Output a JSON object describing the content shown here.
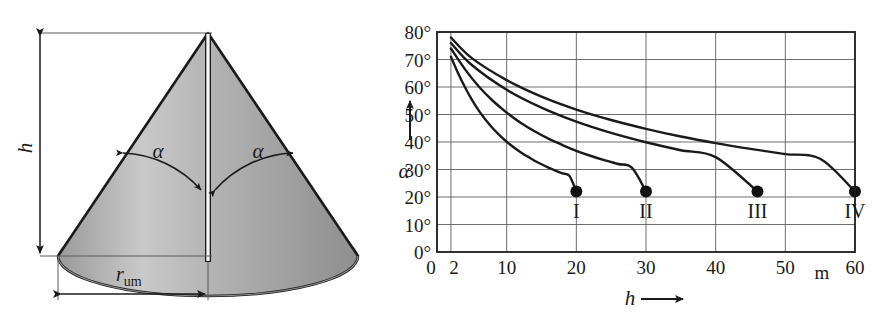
{
  "figure": {
    "cone_diagram": {
      "name": "cone-with-apex-angle",
      "height_label": "h",
      "radius_label_main": "r",
      "radius_label_sub": "um",
      "angle_label_left": "α",
      "angle_label_right": "α",
      "fill_color": "#a8a8a8",
      "edge_color": "#1a1a1a",
      "base_color": "#b4b4b4"
    }
  },
  "chart_data": {
    "type": "line",
    "title": "",
    "xlabel": "h",
    "ylabel": "α",
    "xunit": "m",
    "xlim": [
      0,
      60
    ],
    "ylim": [
      0,
      80
    ],
    "grid": true,
    "legend_position": "inline-at-endpoints",
    "x_tick_labels": [
      "0",
      "2",
      "10",
      "20",
      "30",
      "40",
      "50",
      "60"
    ],
    "x_tick_values": [
      0,
      2,
      10,
      20,
      30,
      40,
      50,
      60
    ],
    "y_tick_labels": [
      "0°",
      "10°",
      "20°",
      "30°",
      "40°",
      "50°",
      "60°",
      "70°",
      "80°"
    ],
    "y_tick_values": [
      0,
      10,
      20,
      30,
      40,
      50,
      60,
      70,
      80
    ],
    "y_axis_arrow": true,
    "x_axis_arrow": true,
    "marker_color": "#111111",
    "line_color": "#1a1a1a",
    "series": [
      {
        "name": "I",
        "endpoint_label": "I",
        "endpoint": [
          20,
          22
        ],
        "x": [
          2,
          3,
          4,
          5,
          6,
          7,
          8,
          9,
          10,
          11,
          12,
          13,
          14,
          15,
          16,
          17,
          18,
          19,
          20
        ],
        "values": [
          71.0,
          65.2,
          60.0,
          55.4,
          51.4,
          48.0,
          45.0,
          42.4,
          40.1,
          38.1,
          36.3,
          34.7,
          33.2,
          31.9,
          30.7,
          29.6,
          28.6,
          27.7,
          22.0
        ]
      },
      {
        "name": "II",
        "endpoint_label": "II",
        "endpoint": [
          30,
          22
        ],
        "x": [
          2,
          4,
          6,
          8,
          10,
          12,
          14,
          16,
          18,
          20,
          22,
          24,
          26,
          28,
          30
        ],
        "values": [
          74.0,
          66.5,
          60.2,
          55.0,
          50.7,
          47.0,
          43.9,
          41.2,
          38.9,
          36.8,
          35.0,
          33.4,
          32.0,
          30.6,
          22.0
        ]
      },
      {
        "name": "III",
        "endpoint_label": "III",
        "endpoint": [
          46,
          22
        ],
        "x": [
          2,
          5,
          10,
          15,
          20,
          25,
          30,
          35,
          40,
          46
        ],
        "values": [
          76.0,
          68.0,
          59.0,
          52.5,
          47.4,
          43.3,
          39.9,
          37.0,
          34.5,
          22.0
        ]
      },
      {
        "name": "IV",
        "endpoint_label": "IV",
        "endpoint": [
          60,
          22
        ],
        "x": [
          2,
          5,
          10,
          15,
          20,
          25,
          30,
          35,
          40,
          45,
          50,
          55,
          60
        ],
        "values": [
          78.0,
          70.5,
          62.5,
          56.5,
          51.8,
          48.0,
          44.8,
          42.0,
          39.6,
          37.5,
          35.6,
          33.9,
          22.0
        ]
      }
    ]
  }
}
